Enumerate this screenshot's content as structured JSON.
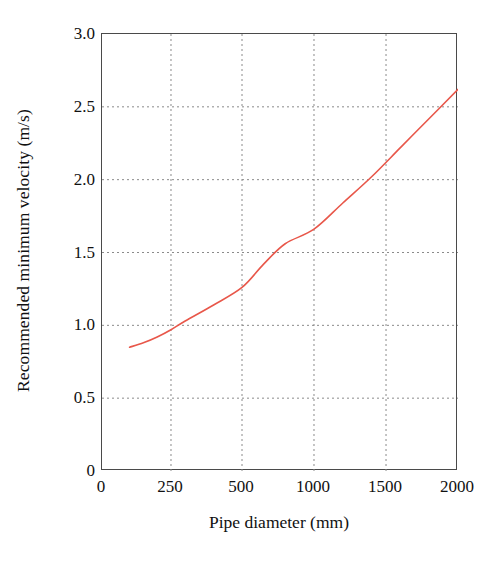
{
  "chart_data": {
    "type": "line",
    "title": "",
    "subtitle": "",
    "xlabel": "Pipe diameter (mm)",
    "ylabel": "Recommended minimum velocity (m/s)",
    "xscale": "nonlinear-compressed",
    "xlim": [
      0,
      2000
    ],
    "ylim": [
      0,
      3.0
    ],
    "grid": true,
    "legend": null,
    "legend_position": "none",
    "x_ticks": [
      0,
      250,
      500,
      1000,
      1500,
      2000
    ],
    "x_tick_labels": [
      "0",
      "250",
      "500",
      "1000",
      "1500",
      "2000"
    ],
    "x_tick_positions_frac": [
      0.0,
      0.1938,
      0.3933,
      0.5955,
      0.7978,
      1.0
    ],
    "y_ticks": [
      0,
      0.5,
      1.0,
      1.5,
      2.0,
      2.5,
      3.0
    ],
    "y_tick_labels": [
      "0",
      "0.5",
      "1.0",
      "1.5",
      "2.0",
      "2.5",
      "3.0"
    ],
    "series": [
      {
        "name": "Recommended minimum velocity",
        "color": "#e8574a",
        "line_width": 1.6,
        "x": [
          100,
          150,
          200,
          250,
          300,
          400,
          500,
          650,
          800,
          1000,
          1200,
          1400,
          1600,
          1800,
          2000
        ],
        "y": [
          0.85,
          0.88,
          0.92,
          0.97,
          1.03,
          1.14,
          1.26,
          1.42,
          1.56,
          1.66,
          1.84,
          2.02,
          2.22,
          2.42,
          2.62
        ]
      }
    ]
  },
  "axes": {
    "x_title": "Pipe diameter (mm)",
    "y_title": "Recommended minimum velocity (m/s)"
  },
  "style": {
    "curve_color": "#e8574a",
    "grid_color": "#8a8a8a",
    "axis_color": "#4a4a4a",
    "text_color": "#111111",
    "background": "#ffffff"
  }
}
